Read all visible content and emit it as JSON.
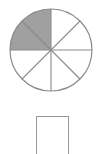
{
  "figure": {
    "shape_name": "circle",
    "total_parts": 8,
    "shaded_parts": 2,
    "unshaded_parts": 6,
    "fraction_shaded": "2/8",
    "shaded_fill_color": "#a0a0a0",
    "unshaded_fill_color": "#ffffff",
    "outline_color": "#8a8a8a",
    "divider_color": "#8a8a8a",
    "shaded_region_position": "upper-left quadrant",
    "sector_angle_degrees": 45,
    "center_x": 51,
    "center_y": 50,
    "radius": 41
  },
  "answer": {
    "value": "",
    "placeholder": ""
  }
}
